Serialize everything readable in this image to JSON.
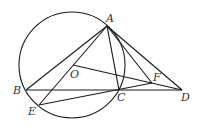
{
  "figure": {
    "type": "geometry",
    "stroke_color": "#1a1a1a",
    "circle": {
      "name": "circle-O",
      "cx": 72,
      "cy": 65,
      "r": 53
    },
    "points": {
      "A": {
        "x": 107,
        "y": 26,
        "label": "A",
        "lx": 106,
        "ly": 22
      },
      "B": {
        "x": 26,
        "y": 90,
        "label": "B",
        "lx": 13,
        "ly": 94
      },
      "C": {
        "x": 119,
        "y": 90,
        "label": "C",
        "lx": 117,
        "ly": 101
      },
      "D": {
        "x": 182,
        "y": 90,
        "label": "D",
        "lx": 181,
        "ly": 101
      },
      "E": {
        "x": 39,
        "y": 105,
        "label": "E",
        "lx": 28,
        "ly": 115
      },
      "F": {
        "x": 152,
        "y": 83,
        "label": "F",
        "lx": 153,
        "ly": 81
      },
      "O": {
        "x": 73,
        "y": 65,
        "label": "O",
        "lx": 70,
        "ly": 78
      }
    },
    "segments": [
      [
        "A",
        "B"
      ],
      [
        "A",
        "E"
      ],
      [
        "A",
        "C"
      ],
      [
        "A",
        "D"
      ],
      [
        "A",
        "F"
      ],
      [
        "B",
        "D"
      ],
      [
        "E",
        "F"
      ],
      [
        "O",
        "D"
      ]
    ]
  }
}
